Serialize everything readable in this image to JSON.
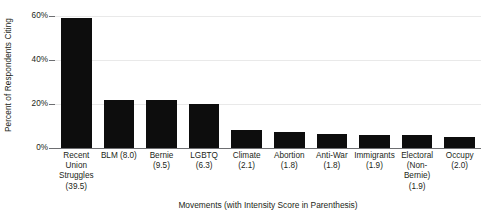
{
  "chart_data": {
    "type": "bar",
    "title": "",
    "xlabel": "Movements (with Intensity Score in Parenthesis)",
    "ylabel": "Percent of Respondents Citing",
    "ylim": [
      0,
      60
    ],
    "yticks": [
      0,
      20,
      40,
      60
    ],
    "ytick_labels": [
      "0%",
      "20%",
      "40%",
      "60%"
    ],
    "grid": true,
    "legend": false,
    "bar_color": "#0d0d0d",
    "gridline_color": "#e9e9e9",
    "axis_color": "#6d6e71",
    "categories": [
      "Recent Union Struggles (39.5)",
      "BLM (8.0)",
      "Bernie (9.5)",
      "LGBTQ (6.3)",
      "Climate (2.1)",
      "Abortion (1.8)",
      "Anti-War (1.8)",
      "Immigrants (1.9)",
      "Electoral (Non-Bernie) (1.9)",
      "Occupy (2.0)"
    ],
    "category_label_lines": [
      [
        "Recent",
        "Union",
        "Struggles",
        "(39.5)"
      ],
      [
        "BLM (8.0)"
      ],
      [
        "Bernie",
        "(9.5)"
      ],
      [
        "LGBTQ",
        "(6.3)"
      ],
      [
        "Climate",
        "(2.1)"
      ],
      [
        "Abortion",
        "(1.8)"
      ],
      [
        "Anti-War",
        "(1.8)"
      ],
      [
        "Immigrants",
        "(1.9)"
      ],
      [
        "Electoral",
        "(Non-",
        "Bernie)",
        "(1.9)"
      ],
      [
        "Occupy",
        "(2.0)"
      ]
    ],
    "intensity_scores": [
      39.5,
      8.0,
      9.5,
      6.3,
      2.1,
      1.8,
      1.8,
      1.9,
      1.9,
      2.0
    ],
    "values": [
      59,
      22,
      22,
      20,
      8,
      7.5,
      6.5,
      6,
      6,
      5
    ]
  }
}
